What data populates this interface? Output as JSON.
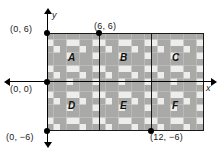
{
  "figure": {
    "type": "coordinate-plane-tessellation",
    "plane_background": "#ededeb",
    "tile_color": "#a9a9a7",
    "axis_color": "#000000"
  },
  "axes": {
    "x_label": "x",
    "y_label": "y"
  },
  "points": [
    {
      "id": "p1",
      "label": "(0, 6)",
      "x": 0,
      "y": 6
    },
    {
      "id": "p2",
      "label": "(6, 6)",
      "x": 6,
      "y": 6
    },
    {
      "id": "p3",
      "label": "(0, 0)",
      "x": 0,
      "y": 0
    },
    {
      "id": "p4",
      "label": "(0, −6)",
      "x": 0,
      "y": -6
    },
    {
      "id": "p5",
      "label": "(12, −6)",
      "x": 12,
      "y": -6
    }
  ],
  "regions": [
    {
      "id": "A",
      "label": "A"
    },
    {
      "id": "B",
      "label": "B"
    },
    {
      "id": "C",
      "label": "C"
    },
    {
      "id": "D",
      "label": "D"
    },
    {
      "id": "E",
      "label": "E"
    },
    {
      "id": "F",
      "label": "F"
    }
  ],
  "grid": {
    "vertical_lines_at_x": [
      6,
      12
    ],
    "rect_left_x": 0,
    "rect_right_x": 18,
    "rect_top_y": 6,
    "rect_bottom_y": -6
  }
}
